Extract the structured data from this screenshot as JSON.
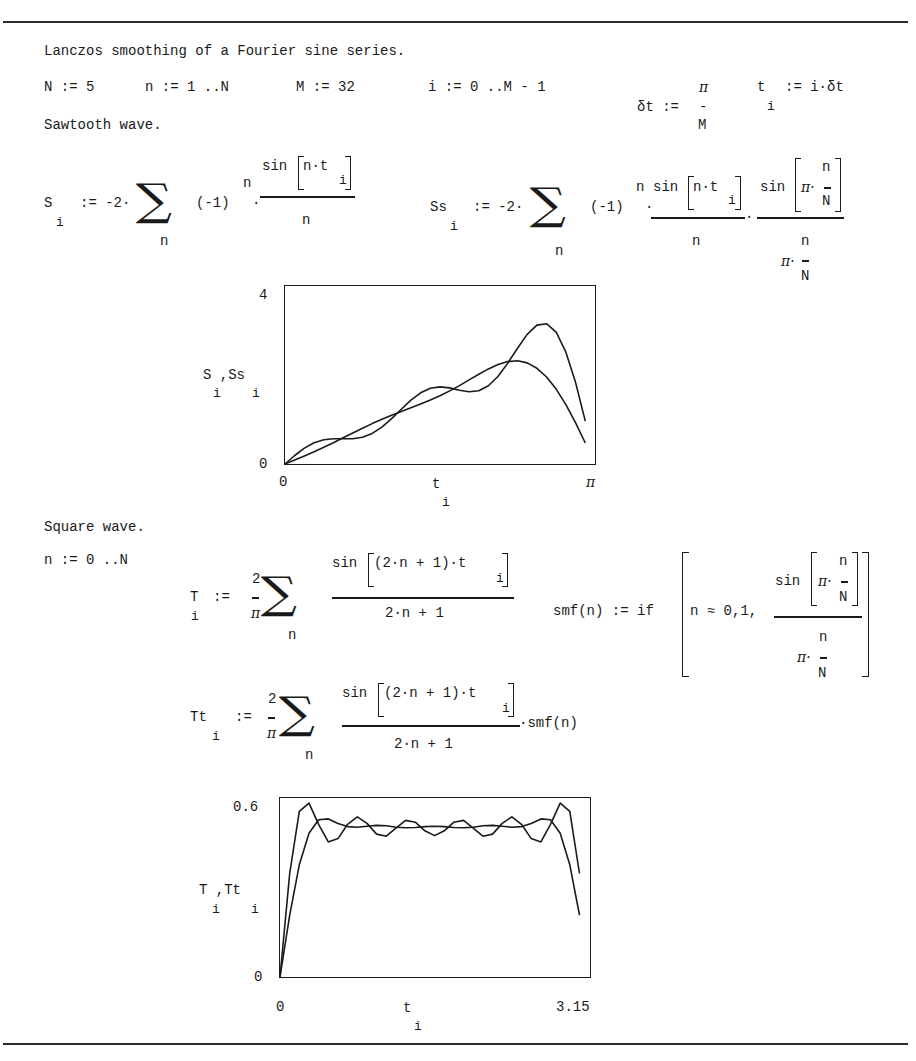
{
  "document": {
    "title": "Lanczos smoothing of a Fourier sine series.",
    "definitions": {
      "N": "N := 5",
      "n_range": "n := 1 ..N",
      "M": "M := 32",
      "i_range": "i := 0 ..M - 1",
      "dt_lhs": "δt :=",
      "dt_num": "π",
      "dt_bar": "-",
      "dt_den": "M",
      "t_lhs": "t",
      "t_sub": "i",
      "t_rhs": ":= i·δt"
    },
    "sawtooth": {
      "heading": "Sawtooth wave.",
      "S_eq": {
        "lhs": "S",
        "sub": "i",
        "assign": ":= -2·",
        "sigma": "∑",
        "sigma_index": "n",
        "factor": "(-1)",
        "exponent": "n",
        "dot": "·",
        "num_fn": "sin",
        "num_arg": "n·t",
        "num_arg_sub": "i",
        "den": "n"
      },
      "Ss_eq": {
        "lhs": "Ss",
        "sub": "i",
        "assign": ":= -2·",
        "sigma": "∑",
        "sigma_index": "n",
        "factor": "(-1)",
        "exponent": "n",
        "dot": "·",
        "num_fn": "sin",
        "num_arg": "n·t",
        "num_arg_sub": "i",
        "den": "n",
        "sigma_num_fn": "sin",
        "sigma_num_pi": "π·",
        "sigma_num_n": "n",
        "sigma_num_N": "N",
        "sigma_den_n": "n",
        "sigma_den_pi": "π·",
        "sigma_den_N": "N"
      }
    },
    "square": {
      "heading": "Square wave.",
      "n_range": "n := 0 ..N",
      "T_eq": {
        "lhs": "T",
        "sub": "i",
        "assign": ":=",
        "coef_num": "2",
        "coef_den": "π",
        "sigma": "∑",
        "sigma_index": "n",
        "num_fn": "sin",
        "num_arg": "(2·n + 1)·t",
        "num_arg_sub": "i",
        "den": "2·n + 1"
      },
      "smf_eq": {
        "lhs": "smf(n) := if",
        "cond": "n ≈ 0,1,",
        "num_fn": "sin",
        "num_pi": "π·",
        "num_n": "n",
        "num_N": "N",
        "den_n": "n",
        "den_pi": "π·",
        "den_N": "N"
      },
      "Tt_eq": {
        "lhs": "Tt",
        "sub": "i",
        "assign": ":=",
        "coef_num": "2",
        "coef_den": "π",
        "sigma": "∑",
        "sigma_index": "n",
        "num_fn": "sin",
        "num_arg": "(2·n + 1)·t",
        "num_arg_sub": "i",
        "den": "2·n + 1",
        "tail": "·smf(n)"
      }
    }
  },
  "chart_data": [
    {
      "type": "line",
      "title": "Sawtooth wave",
      "xlabel": "t",
      "xlabel_sub": "i",
      "ylabel": "S ,Ss",
      "ylabel_subs": "i    i",
      "x_ticks": [
        "0",
        "π"
      ],
      "y_ticks": [
        "0",
        "4"
      ],
      "xlim": [
        0,
        3.1416
      ],
      "ylim": [
        0,
        4
      ],
      "grid": false,
      "legend": "none",
      "x": [
        0,
        0.0982,
        0.1963,
        0.2945,
        0.3927,
        0.4909,
        0.589,
        0.6872,
        0.7854,
        0.8836,
        0.9817,
        1.0799,
        1.1781,
        1.2763,
        1.3744,
        1.4726,
        1.5708,
        1.669,
        1.7671,
        1.8653,
        1.9635,
        2.0617,
        2.1598,
        2.258,
        2.3562,
        2.4544,
        2.5525,
        2.6507,
        2.7489,
        2.8471,
        2.9452,
        3.0434
      ],
      "series": [
        {
          "name": "S",
          "values": [
            0,
            0.192,
            0.357,
            0.477,
            0.544,
            0.567,
            0.566,
            0.568,
            0.603,
            0.688,
            0.83,
            1.02,
            1.232,
            1.437,
            1.6,
            1.701,
            1.733,
            1.709,
            1.659,
            1.624,
            1.647,
            1.759,
            1.971,
            2.267,
            2.603,
            2.913,
            3.121,
            3.153,
            2.958,
            2.512,
            1.829,
            0.965
          ]
        },
        {
          "name": "Ss",
          "values": [
            0,
            0.089,
            0.18,
            0.275,
            0.375,
            0.479,
            0.588,
            0.697,
            0.804,
            0.907,
            1.005,
            1.096,
            1.182,
            1.265,
            1.348,
            1.437,
            1.535,
            1.643,
            1.762,
            1.89,
            2.018,
            2.138,
            2.238,
            2.302,
            2.318,
            2.271,
            2.151,
            1.954,
            1.679,
            1.332,
            0.924,
            0.473
          ]
        }
      ]
    },
    {
      "type": "line",
      "title": "Square wave",
      "xlabel": "t",
      "xlabel_sub": "i",
      "ylabel": "T ,Tt",
      "ylabel_subs": "i    i",
      "x_ticks": [
        "0",
        "3.15"
      ],
      "y_ticks": [
        "0",
        "0.6"
      ],
      "xlim": [
        0,
        3.15
      ],
      "ylim": [
        0,
        0.6
      ],
      "grid": false,
      "legend": "none",
      "x": [
        0,
        0.0982,
        0.1963,
        0.2945,
        0.3927,
        0.4909,
        0.589,
        0.6872,
        0.7854,
        0.8836,
        0.9817,
        1.0799,
        1.1781,
        1.2763,
        1.3744,
        1.4726,
        1.5708,
        1.669,
        1.7671,
        1.8653,
        1.9635,
        2.0617,
        2.1598,
        2.258,
        2.3562,
        2.4544,
        2.5525,
        2.6507,
        2.7489,
        2.8471,
        2.9452,
        3.0434
      ],
      "series": [
        {
          "name": "T",
          "values": [
            0,
            0.347,
            0.555,
            0.583,
            0.512,
            0.453,
            0.464,
            0.512,
            0.537,
            0.515,
            0.479,
            0.472,
            0.499,
            0.525,
            0.519,
            0.49,
            0.474,
            0.49,
            0.519,
            0.525,
            0.499,
            0.472,
            0.479,
            0.515,
            0.537,
            0.512,
            0.464,
            0.453,
            0.512,
            0.583,
            0.555,
            0.347
          ]
        },
        {
          "name": "Tt",
          "values": [
            0,
            0.207,
            0.376,
            0.482,
            0.527,
            0.53,
            0.515,
            0.504,
            0.502,
            0.505,
            0.508,
            0.507,
            0.502,
            0.5,
            0.501,
            0.504,
            0.505,
            0.504,
            0.501,
            0.5,
            0.502,
            0.507,
            0.508,
            0.505,
            0.502,
            0.504,
            0.515,
            0.53,
            0.527,
            0.482,
            0.376,
            0.207
          ]
        }
      ]
    }
  ]
}
